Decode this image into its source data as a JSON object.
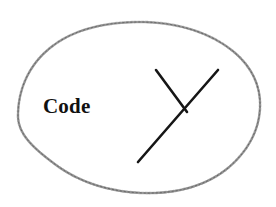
{
  "figure": {
    "kind": "hand-drawn-diagram",
    "background_color": "#ffffff",
    "width": 276,
    "height": 207,
    "label": {
      "text": "Code",
      "color": "#111111",
      "style": "bold-serif",
      "position": {
        "x": 43,
        "y": 96
      }
    },
    "blob": {
      "name": "hand-drawn-closed-curve",
      "stroke_color": "#787878",
      "fill": "none",
      "bounds": {
        "left": 18,
        "top": 22,
        "right": 261,
        "bottom": 193
      },
      "path": "M 18 116 C 18 88 30 64 50 48 C 72 30 104 22 140 22 C 176 22 210 32 234 52 C 253 68 261 88 260 108 C 259 131 247 152 228 168 C 206 186 176 194 143 193 C 110 192 79 182 56 165 C 33 148 18 134 18 116 Z"
    },
    "mark": {
      "name": "y-shaped-annotation",
      "stroke_color": "#161616",
      "stroke_width": 2.6,
      "segments": [
        {
          "name": "long-diagonal",
          "x1": 138,
          "y1": 162,
          "x2": 218,
          "y2": 70
        },
        {
          "name": "short-branch",
          "x1": 156,
          "y1": 70,
          "x2": 187,
          "y2": 112
        }
      ],
      "junction": {
        "x": 187,
        "y": 112
      }
    }
  }
}
